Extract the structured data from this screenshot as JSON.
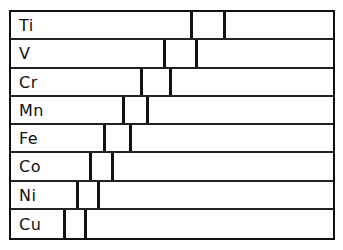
{
  "diagram": {
    "type": "element-band-positions",
    "frame": {
      "left": 9,
      "top": 10,
      "width": 326,
      "height": 230
    },
    "rows": [
      {
        "label": "Ti",
        "line_left": 191,
        "line_right": 224
      },
      {
        "label": "V",
        "line_left": 164,
        "line_right": 196
      },
      {
        "label": "Cr",
        "line_left": 141,
        "line_right": 170
      },
      {
        "label": "Mn",
        "line_left": 123,
        "line_right": 147
      },
      {
        "label": "Fe",
        "line_left": 104,
        "line_right": 130
      },
      {
        "label": "Co",
        "line_left": 90,
        "line_right": 112
      },
      {
        "label": "Ni",
        "line_left": 77,
        "line_right": 98
      },
      {
        "label": "Cu",
        "line_left": 64,
        "line_right": 85
      }
    ]
  },
  "colors": {
    "line": "#111111",
    "background": "#ffffff"
  }
}
